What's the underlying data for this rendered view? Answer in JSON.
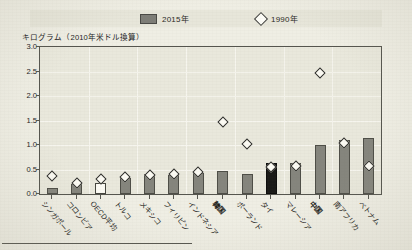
{
  "legend": {
    "series_2015_label": "2015年",
    "series_1990_label": "1990年",
    "bar_icon": "bar-swatch-icon",
    "diamond_icon": "diamond-marker-icon"
  },
  "axis_caption": "キログラム（2010年米ドル換算）",
  "y_ticks": [
    "3.0",
    "2.5",
    "2.0",
    "1.5",
    "1.0",
    "0.5",
    "0.0"
  ],
  "chart_data": {
    "type": "bar",
    "title": "",
    "subtitle": "",
    "xlabel": "",
    "ylabel": "キログラム（2010年米ドル換算）",
    "ylim": [
      0.0,
      3.0
    ],
    "ytick_step": 0.5,
    "grid": true,
    "legend_position": "top",
    "categories": [
      "シンガポール",
      "コロンビア",
      "OECD平均",
      "トルコ",
      "メキシコ",
      "フィリピン",
      "インドネシア",
      "韓国",
      "ポーランド",
      "タイ",
      "マレーシア",
      "中国",
      "南アフリカ",
      "ベトナム"
    ],
    "series": [
      {
        "name": "2015年",
        "type": "bar",
        "color": "#85857d",
        "values": [
          0.13,
          0.2,
          0.22,
          0.33,
          0.4,
          0.38,
          0.42,
          0.47,
          0.4,
          0.63,
          0.63,
          1.0,
          1.1,
          1.15
        ],
        "highlights": [
          {
            "index": 2,
            "style": "hollow",
            "color": "#fbfaf3"
          },
          {
            "index": 9,
            "style": "filled-black",
            "color": "#1a1a18"
          }
        ]
      },
      {
        "name": "1990年",
        "type": "scatter",
        "marker": "diamond",
        "color": "#fcfbf4",
        "values": [
          0.44,
          0.3,
          0.39,
          0.43,
          0.46,
          0.48,
          0.53,
          1.55,
          1.1,
          0.63,
          0.65,
          2.55,
          1.13,
          0.65
        ]
      }
    ],
    "emphasized_categories": [
      "タイ",
      "中国",
      "韓国"
    ]
  }
}
